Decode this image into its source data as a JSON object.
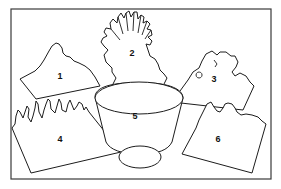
{
  "figure": {
    "type": "numbered-block-diagram",
    "frame": {
      "stroke": "#3a3a3a",
      "background": "#ffffff"
    },
    "pieces": [
      {
        "id": "1",
        "label": "1",
        "shape": "tilted block with mountainous ridge"
      },
      {
        "id": "2",
        "label": "2",
        "shape": "radiating finger-like tree / coral outline"
      },
      {
        "id": "3",
        "label": "3",
        "shape": "tilted block with rugged coastline top"
      },
      {
        "id": "4",
        "label": "4",
        "shape": "tilted block with jagged spiky top"
      },
      {
        "id": "5",
        "label": "5",
        "shape": "central bowl (ellipse with tapering sides)"
      },
      {
        "id": "6",
        "label": "6",
        "shape": "tilted block with scalloped top"
      }
    ]
  }
}
